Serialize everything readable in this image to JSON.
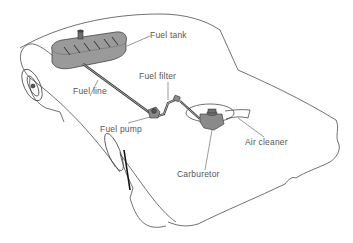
{
  "diagram": {
    "colors": {
      "outline": "#333333",
      "component_fill": "#9a9a9a",
      "component_dark": "#6e6e6e",
      "label_text": "#555555",
      "background": "#ffffff"
    },
    "labels": {
      "fuel_tank": "Fuel tank",
      "fuel_line": "Fuel line",
      "fuel_filter": "Fuel filter",
      "fuel_pump": "Fuel pump",
      "air_cleaner": "Air cleaner",
      "carburetor": "Carburetor"
    },
    "components": [
      {
        "id": "fuel_tank",
        "label": "Fuel tank"
      },
      {
        "id": "fuel_line",
        "label": "Fuel line"
      },
      {
        "id": "fuel_filter",
        "label": "Fuel filter"
      },
      {
        "id": "fuel_pump",
        "label": "Fuel pump"
      },
      {
        "id": "carburetor",
        "label": "Carburetor"
      },
      {
        "id": "air_cleaner",
        "label": "Air cleaner"
      }
    ],
    "flow": [
      "fuel_tank",
      "fuel_line",
      "fuel_pump",
      "fuel_filter",
      "carburetor"
    ]
  }
}
